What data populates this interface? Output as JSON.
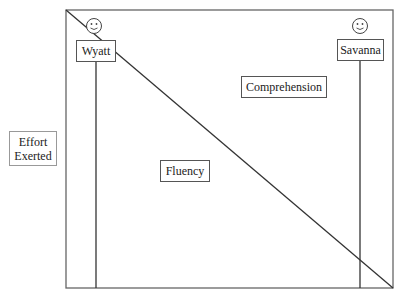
{
  "diagram": {
    "y_axis_label": {
      "line1": "Effort",
      "line2": "Exerted"
    },
    "students": [
      {
        "name": "Wyatt",
        "icon": "smiley-face-icon"
      },
      {
        "name": "Savanna",
        "icon": "smiley-face-icon"
      }
    ],
    "regions": {
      "upper_right": "Comprehension",
      "lower_left": "Fluency"
    },
    "colors": {
      "line": "#333333",
      "frame": "#666666",
      "box_border": "#555555",
      "background": "#ffffff"
    }
  }
}
